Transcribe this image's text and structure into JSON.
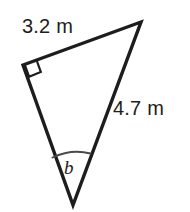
{
  "figure": {
    "type": "right-triangle-diagram",
    "background_color": "#ffffff",
    "stroke_color": "#1d1d1d",
    "text_color": "#1d1d1d",
    "labels": {
      "side_top": "3.2 m",
      "side_right": "4.7 m",
      "angle_unknown": "b"
    },
    "markers": {
      "right_angle_vertex": "top-left",
      "angle_arc_vertex": "bottom"
    },
    "geometry": {
      "vertex_left": [
        23,
        65
      ],
      "vertex_apex": [
        141,
        22
      ],
      "vertex_bottom": [
        73,
        205
      ],
      "right_angle_marker_size": 15,
      "arc_start": [
        53,
        158
      ],
      "arc_end": [
        90,
        154
      ]
    }
  }
}
